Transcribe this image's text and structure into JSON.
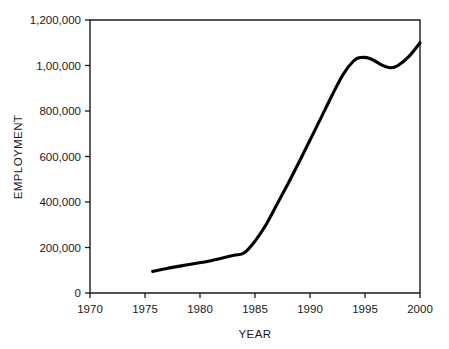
{
  "chart_data": {
    "type": "line",
    "title": "",
    "xlabel": "YEAR",
    "ylabel": "EMPLOYMENT",
    "xlim": [
      1970,
      2000
    ],
    "ylim": [
      0,
      1200000
    ],
    "grid": false,
    "legend": null,
    "x_ticks": [
      1970,
      1975,
      1980,
      1985,
      1990,
      1995,
      2000
    ],
    "x_tick_labels": [
      "1970",
      "1975",
      "1980",
      "1985",
      "1990",
      "1995",
      "2000"
    ],
    "y_ticks": [
      0,
      200000,
      400000,
      600000,
      800000,
      1000000,
      1200000
    ],
    "y_tick_labels": [
      "0",
      "200,000",
      "400,000",
      "600,000",
      "800,000",
      "1,00,000",
      "1,200,000"
    ],
    "series": [
      {
        "name": "Employment",
        "color": "#000000",
        "x": [
          1975.7,
          1977.0,
          1979.0,
          1981.0,
          1983.0,
          1984.0,
          1985.0,
          1986.0,
          1987.0,
          1988.0,
          1989.0,
          1990.0,
          1991.0,
          1992.0,
          1993.0,
          1994.0,
          1994.6,
          1995.5,
          1996.5,
          1997.3,
          1998.0,
          1999.0,
          2000.0
        ],
        "values": [
          95000,
          108000,
          125000,
          142000,
          165000,
          176000,
          228000,
          300000,
          390000,
          480000,
          575000,
          672000,
          770000,
          868000,
          960000,
          1022000,
          1035000,
          1030000,
          1003000,
          990000,
          1000000,
          1040000,
          1100000
        ]
      }
    ],
    "annotations": [
      {
        "text": "The 1,000,000 y-axis tick is printed as \"1,00,000\" in the source figure.",
        "kind": "tick-label-typo"
      }
    ]
  },
  "axes": {
    "y_axis_title": "EMPLOYMENT",
    "x_axis_title": "YEAR"
  }
}
